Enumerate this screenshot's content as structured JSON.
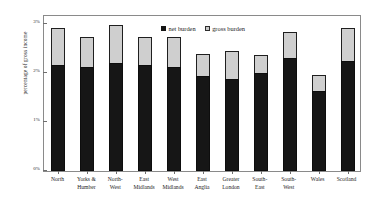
{
  "chart_data": {
    "type": "bar",
    "subtype": "stacked",
    "title": "",
    "xlabel": "",
    "ylabel": "percentage of gross income",
    "ylim": [
      0,
      3.2
    ],
    "yticks": [
      0,
      1,
      2,
      3
    ],
    "ytick_labels": [
      "0%",
      "1%",
      "2%",
      "3%"
    ],
    "grid": false,
    "legend_position": "top-center",
    "categories": [
      "North",
      "Yorks & Humber",
      "North-West",
      "East Midlands",
      "West Midlands",
      "East Anglia",
      "Greater London",
      "South-East",
      "South-West",
      "Wales",
      "Scotland"
    ],
    "category_lines": [
      [
        "North"
      ],
      [
        "Yorks &",
        "Humber"
      ],
      [
        "North-",
        "West"
      ],
      [
        "East",
        "Midlands"
      ],
      [
        "West",
        "Midlands"
      ],
      [
        "East",
        "Anglia"
      ],
      [
        "Greater",
        "London"
      ],
      [
        "South-",
        "East"
      ],
      [
        "South-",
        "West"
      ],
      [
        "Wales"
      ],
      [
        "Scotland"
      ]
    ],
    "series": [
      {
        "name": "net burden",
        "color": "#161616",
        "values": [
          2.17,
          2.11,
          2.2,
          2.17,
          2.12,
          1.93,
          1.88,
          2.0,
          2.3,
          1.63,
          2.25
        ]
      },
      {
        "name": "gross burden",
        "color": "#cfcfcf",
        "values": [
          2.92,
          2.73,
          2.98,
          2.73,
          2.73,
          2.38,
          2.45,
          2.36,
          2.83,
          1.95,
          2.92
        ]
      }
    ],
    "legend": [
      {
        "label": "net burden",
        "swatch": "net"
      },
      {
        "label": "gross burden",
        "swatch": "gross"
      }
    ]
  }
}
